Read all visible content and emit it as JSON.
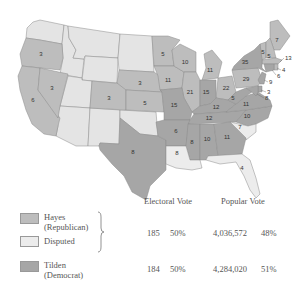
{
  "colors": {
    "hayes": "#bdbdbd",
    "disputed": "#ececec",
    "tilden": "#a6a6a6",
    "non_state": "#e4e4e4",
    "border": "#8a8a8a"
  },
  "map": {
    "states": [
      {
        "code": "OR",
        "party": "hayes",
        "votes": "3"
      },
      {
        "code": "CA",
        "party": "hayes",
        "votes": "6"
      },
      {
        "code": "NV",
        "party": "hayes",
        "votes": "3"
      },
      {
        "code": "CO",
        "party": "hayes",
        "votes": "3"
      },
      {
        "code": "NE",
        "party": "hayes",
        "votes": "3"
      },
      {
        "code": "KS",
        "party": "hayes",
        "votes": "5"
      },
      {
        "code": "MN",
        "party": "hayes",
        "votes": "5"
      },
      {
        "code": "IA",
        "party": "hayes",
        "votes": "11"
      },
      {
        "code": "WI",
        "party": "hayes",
        "votes": "10"
      },
      {
        "code": "IL",
        "party": "hayes",
        "votes": "21"
      },
      {
        "code": "MI",
        "party": "hayes",
        "votes": "11"
      },
      {
        "code": "OH",
        "party": "hayes",
        "votes": "22"
      },
      {
        "code": "PA",
        "party": "hayes",
        "votes": "29"
      },
      {
        "code": "ME",
        "party": "hayes",
        "votes": "7"
      },
      {
        "code": "VT",
        "party": "hayes",
        "votes": "5"
      },
      {
        "code": "NH",
        "party": "hayes",
        "votes": "5"
      },
      {
        "code": "MA",
        "party": "hayes",
        "votes": "13"
      },
      {
        "code": "RI",
        "party": "hayes",
        "votes": "4"
      },
      {
        "code": "TX",
        "party": "tilden",
        "votes": "8"
      },
      {
        "code": "MO",
        "party": "tilden",
        "votes": "15"
      },
      {
        "code": "AR",
        "party": "tilden",
        "votes": "6"
      },
      {
        "code": "IN",
        "party": "tilden",
        "votes": "15"
      },
      {
        "code": "KY",
        "party": "tilden",
        "votes": "12"
      },
      {
        "code": "TN",
        "party": "tilden",
        "votes": "12"
      },
      {
        "code": "MS",
        "party": "tilden",
        "votes": "8"
      },
      {
        "code": "AL",
        "party": "tilden",
        "votes": "10"
      },
      {
        "code": "GA",
        "party": "tilden",
        "votes": "11"
      },
      {
        "code": "NC",
        "party": "tilden",
        "votes": "10"
      },
      {
        "code": "VA",
        "party": "tilden",
        "votes": "11"
      },
      {
        "code": "WV",
        "party": "tilden",
        "votes": "5"
      },
      {
        "code": "NY",
        "party": "tilden",
        "votes": "35"
      },
      {
        "code": "NJ",
        "party": "tilden",
        "votes": "9"
      },
      {
        "code": "CT",
        "party": "tilden",
        "votes": "6"
      },
      {
        "code": "DE",
        "party": "tilden",
        "votes": "3"
      },
      {
        "code": "MD",
        "party": "tilden",
        "votes": "8"
      },
      {
        "code": "SC",
        "party": "disputed",
        "votes": "7"
      },
      {
        "code": "LA",
        "party": "disputed",
        "votes": "8"
      },
      {
        "code": "FL",
        "party": "disputed",
        "votes": "4"
      }
    ]
  },
  "results": {
    "headers": {
      "electoral": "Electoral Vote",
      "popular": "Popular Vote"
    },
    "legend": [
      {
        "key": "hayes",
        "label_line1": "Hayes",
        "label_line2": "(Republican)"
      },
      {
        "key": "disputed",
        "label_line1": "Disputed",
        "label_line2": ""
      },
      {
        "key": "tilden",
        "label_line1": "Tilden",
        "label_line2": "(Democrat)"
      }
    ],
    "rows": [
      {
        "candidate": "Hayes + Disputed",
        "electoral_votes": "185",
        "electoral_pct": "50%",
        "popular_votes": "4,036,572",
        "popular_pct": "48%"
      },
      {
        "candidate": "Tilden",
        "electoral_votes": "184",
        "electoral_pct": "50%",
        "popular_votes": "4,284,020",
        "popular_pct": "51%"
      }
    ]
  }
}
